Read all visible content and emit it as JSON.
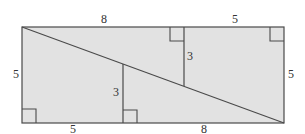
{
  "diagram": {
    "colors": {
      "fill": "#e2e2e2",
      "stroke": "#4a4a4a",
      "text": "#333333"
    },
    "labels": {
      "top_left_segment": "8",
      "top_right_segment": "5",
      "left_side": "5",
      "right_side": "5",
      "bottom_left_segment": "5",
      "bottom_right_segment": "8",
      "upper_height": "3",
      "lower_height": "3"
    }
  }
}
